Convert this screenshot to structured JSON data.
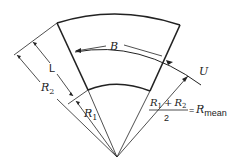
{
  "diagram": {
    "type": "annular sector (curved duct cross-section) geometry",
    "labels": {
      "width": "B",
      "length": "L",
      "outer_radius": "R",
      "outer_radius_sub": "2",
      "inner_radius": "R",
      "inner_radius_sub": "1",
      "velocity": "U",
      "formula_num_r1": "R",
      "formula_num_r1_sub": "1",
      "formula_plus": "+",
      "formula_num_r2": "R",
      "formula_num_r2_sub": "2",
      "formula_den": "2",
      "formula_eq": "=",
      "formula_rhs": "R",
      "formula_rhs_sub": "mean"
    }
  }
}
